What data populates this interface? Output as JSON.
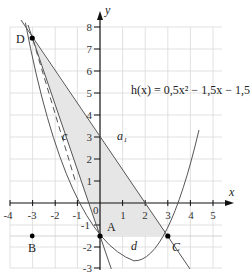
{
  "figure": {
    "function_label": "h(x) = 0,5x² − 1,5x − 1,5",
    "axis_x_label": "x",
    "axis_y_label": "y",
    "origin_label": "0",
    "x_ticks": [
      "-4",
      "-3",
      "-2",
      "-1",
      "1",
      "2",
      "3",
      "4",
      "5"
    ],
    "y_ticks": [
      "8",
      "7",
      "6",
      "5",
      "4",
      "3",
      "2",
      "1",
      "-1",
      "-2",
      "-3"
    ],
    "points": [
      {
        "name": "D",
        "x": -3,
        "y": 7.5
      },
      {
        "name": "A",
        "x": 0,
        "y": -1.5
      },
      {
        "name": "B",
        "x": -3,
        "y": -1.5
      },
      {
        "name": "C",
        "x": 3,
        "y": -1.5
      }
    ],
    "curve_labels": {
      "c": "c",
      "d": "d",
      "a1": "a₁"
    },
    "colors": {
      "shade": "#e6e6e6",
      "curve": "#555555",
      "grid": "#d9d9d9",
      "axis": "#111111"
    }
  }
}
